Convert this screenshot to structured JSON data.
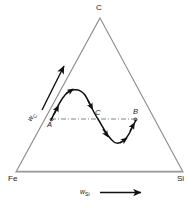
{
  "diagram": {
    "type": "ternary-phase-diagram",
    "title": "",
    "vertices": [
      {
        "id": "top",
        "label": "C",
        "x": 100,
        "y": 18
      },
      {
        "id": "bottom-left",
        "label": "Fe",
        "x": 16,
        "y": 172
      },
      {
        "id": "bottom-right",
        "label": "Si",
        "x": 183,
        "y": 172
      }
    ],
    "axes": [
      {
        "id": "x-axis",
        "label_symbol": "w",
        "label_sub": "Si",
        "direction": "right",
        "x1": 78,
        "y1": 193,
        "x2": 140,
        "y2": 193
      },
      {
        "id": "left-axis",
        "label_symbol": "w",
        "label_sub": "C",
        "direction": "up-right",
        "x1": 42,
        "y1": 107,
        "x2": 64,
        "y2": 67
      }
    ],
    "points": [
      {
        "label": "A",
        "x": 52,
        "y": 119,
        "marker": "circle"
      },
      {
        "label": "C",
        "x": 98,
        "y": 119,
        "marker": "none"
      },
      {
        "label": "B",
        "x": 135,
        "y": 119,
        "marker": "circle"
      }
    ],
    "tie_line": {
      "style": "dash-dot",
      "x1": 51,
      "y1": 119,
      "x2": 136,
      "y2": 119
    },
    "curve": {
      "style": "solid",
      "description": "sinusoidal reaction path from A rising to a maximum, crossing the tie line at C, falling to a minimum, then rising to B",
      "arrow_count": 6,
      "path_points": [
        {
          "x": 51,
          "y": 120
        },
        {
          "x": 57,
          "y": 108
        },
        {
          "x": 63,
          "y": 98
        },
        {
          "x": 70,
          "y": 91
        },
        {
          "x": 77,
          "y": 89
        },
        {
          "x": 84,
          "y": 94
        },
        {
          "x": 90,
          "y": 105
        },
        {
          "x": 97,
          "y": 118
        },
        {
          "x": 104,
          "y": 131
        },
        {
          "x": 110,
          "y": 139
        },
        {
          "x": 117,
          "y": 143
        },
        {
          "x": 124,
          "y": 139
        },
        {
          "x": 130,
          "y": 130
        },
        {
          "x": 136,
          "y": 120
        }
      ]
    },
    "colors": {
      "triangle_stroke": "#8c8c8c",
      "curve_stroke": "#111111",
      "tie_line_stroke": "#777777",
      "text": "#1a1a1a",
      "background": "#ffffff"
    }
  }
}
